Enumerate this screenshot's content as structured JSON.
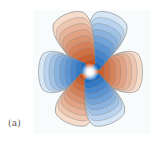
{
  "figure": {
    "panel_label": "(a)",
    "center": [
      90,
      72
    ],
    "colors": {
      "positive": "#c4511e",
      "positive_light": "#f6dccb",
      "negative": "#1e6bbf",
      "negative_light": "#d6e6f6",
      "contour_line": "#8a8a8a",
      "background": "#f7fbfb",
      "center_glow": "#ffffff"
    },
    "lobes": [
      {
        "name": "right",
        "sign": "positive",
        "angle_deg": 0,
        "length": 52,
        "width": 26
      },
      {
        "name": "upper-right",
        "sign": "negative",
        "angle_deg": -68,
        "length": 62,
        "width": 24
      },
      {
        "name": "upper-left",
        "sign": "positive",
        "angle_deg": -112,
        "length": 62,
        "width": 24
      },
      {
        "name": "left",
        "sign": "negative",
        "angle_deg": 180,
        "length": 51,
        "width": 26
      },
      {
        "name": "lower-left",
        "sign": "positive",
        "angle_deg": 112,
        "length": 55,
        "width": 24
      },
      {
        "name": "lower-right",
        "sign": "negative",
        "angle_deg": 68,
        "length": 55,
        "width": 24
      }
    ],
    "contour_levels": 9
  }
}
